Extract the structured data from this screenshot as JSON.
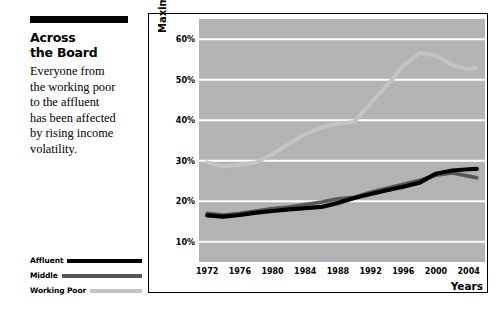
{
  "sidebar": {
    "headline_lines": [
      "Across",
      "the Board"
    ],
    "deck_lines": [
      "Everyone from",
      "the working poor",
      "to the affluent",
      "has been affected",
      "by rising income",
      "volatility."
    ]
  },
  "legend": {
    "items": [
      {
        "label": "Affluent",
        "color": "#000000"
      },
      {
        "label": "Middle",
        "color": "#585858"
      },
      {
        "label": "Working Poor",
        "color": "#c4c4c4"
      }
    ]
  },
  "chart_data": {
    "type": "line",
    "title": "",
    "xlabel": "Years",
    "ylabel": "Maximum annual income swings",
    "plot_background": "#b3b3b3",
    "gridlines": true,
    "grid_color": "#ffffff",
    "legend_position": "outside-bottom-left",
    "xlim": [
      1971,
      2006
    ],
    "ylim": [
      5,
      65
    ],
    "ytick_labels": [
      "10%",
      "20%",
      "30%",
      "40%",
      "50%",
      "60%"
    ],
    "ytick_values": [
      10,
      20,
      30,
      40,
      50,
      60
    ],
    "xtick_labels": [
      "1972",
      "1976",
      "1980",
      "1984",
      "1988",
      "1992",
      "1996",
      "2000",
      "2004"
    ],
    "xtick_values": [
      1972,
      1976,
      1980,
      1984,
      1988,
      1992,
      1996,
      2000,
      2004
    ],
    "x": [
      1972,
      1974,
      1976,
      1978,
      1980,
      1982,
      1984,
      1986,
      1988,
      1990,
      1992,
      1994,
      1996,
      1998,
      2000,
      2002,
      2004,
      2005
    ],
    "series": [
      {
        "name": "Affluent",
        "color": "#000000",
        "values": [
          16.5,
          16.2,
          16.6,
          17.2,
          17.6,
          18.0,
          18.3,
          18.6,
          19.6,
          20.8,
          21.8,
          22.7,
          23.6,
          24.6,
          26.8,
          27.6,
          27.9,
          28.0
        ]
      },
      {
        "name": "Middle",
        "color": "#585858",
        "values": [
          17.0,
          16.6,
          17.0,
          17.6,
          18.2,
          18.6,
          19.2,
          19.8,
          20.6,
          21.0,
          22.2,
          23.2,
          24.2,
          25.2,
          26.4,
          27.0,
          26.2,
          25.8
        ]
      },
      {
        "name": "Working Poor",
        "color": "#c4c4c4",
        "values": [
          29.6,
          28.6,
          29.0,
          29.6,
          31.6,
          34.2,
          36.6,
          38.2,
          39.2,
          39.6,
          44.2,
          48.6,
          53.4,
          56.6,
          56.0,
          53.6,
          52.6,
          53.0
        ]
      }
    ]
  }
}
